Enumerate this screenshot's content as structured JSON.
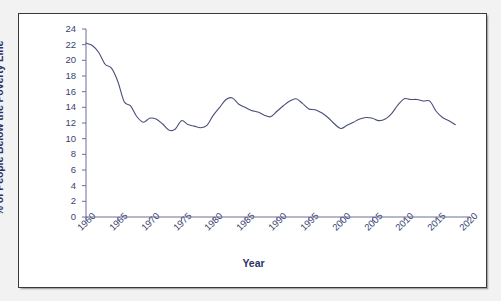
{
  "chart_data": {
    "type": "line",
    "title": "",
    "xlabel": "Year",
    "ylabel": "% of People Below the Poverty Line",
    "xlim": [
      1960,
      2020
    ],
    "ylim": [
      0,
      24
    ],
    "xticks": [
      1960,
      1965,
      1970,
      1975,
      1980,
      1985,
      1990,
      1995,
      2000,
      2005,
      2010,
      2015,
      2020
    ],
    "yticks": [
      0,
      2,
      4,
      6,
      8,
      10,
      12,
      14,
      16,
      18,
      20,
      22,
      24
    ],
    "xtick_labels": [
      "1960",
      "1965",
      "1970",
      "1975",
      "1980",
      "1985",
      "1990",
      "1995",
      "2000",
      "2005",
      "2010",
      "2015",
      "2020"
    ],
    "ytick_labels": [
      "0",
      "2",
      "4",
      "6",
      "8",
      "10",
      "12",
      "14",
      "16",
      "18",
      "20",
      "22",
      "24"
    ],
    "grid": false,
    "legend": false,
    "line_color": "#4a4f7a",
    "series": [
      {
        "name": "Poverty rate",
        "x": [
          1960,
          1961,
          1962,
          1963,
          1964,
          1965,
          1966,
          1967,
          1968,
          1969,
          1970,
          1971,
          1972,
          1973,
          1974,
          1975,
          1976,
          1977,
          1978,
          1979,
          1980,
          1981,
          1982,
          1983,
          1984,
          1985,
          1986,
          1987,
          1988,
          1989,
          1990,
          1991,
          1992,
          1993,
          1994,
          1995,
          1996,
          1997,
          1998,
          1999,
          2000,
          2001,
          2002,
          2003,
          2004,
          2005,
          2006,
          2007,
          2008,
          2009,
          2010,
          2011,
          2012,
          2013,
          2014,
          2015,
          2016,
          2017,
          2018
        ],
        "values": [
          22.2,
          21.9,
          21.0,
          19.5,
          19.0,
          17.3,
          14.7,
          14.2,
          12.8,
          12.1,
          12.6,
          12.5,
          11.9,
          11.1,
          11.2,
          12.3,
          11.8,
          11.6,
          11.4,
          11.7,
          13.0,
          14.0,
          15.0,
          15.2,
          14.4,
          14.0,
          13.6,
          13.4,
          13.0,
          12.8,
          13.5,
          14.2,
          14.8,
          15.1,
          14.5,
          13.8,
          13.7,
          13.3,
          12.7,
          11.9,
          11.3,
          11.7,
          12.1,
          12.5,
          12.7,
          12.6,
          12.3,
          12.5,
          13.2,
          14.3,
          15.1,
          15.0,
          15.0,
          14.8,
          14.8,
          13.5,
          12.7,
          12.3,
          11.8
        ]
      }
    ]
  }
}
